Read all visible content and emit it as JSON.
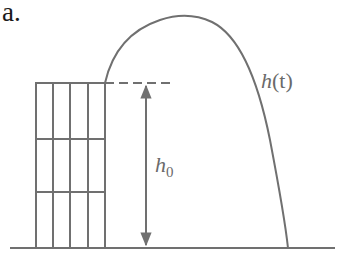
{
  "panel_label": "a.",
  "labels": {
    "trajectory": "h(t)",
    "trajectory_var": "h",
    "trajectory_arg": "(t)",
    "height_var": "h",
    "height_sub": "0"
  },
  "colors": {
    "line": "#707070",
    "text": "#6a6a6a",
    "panel_label": "#1a1a1a",
    "background": "#ffffff"
  },
  "building": {
    "columns": 4,
    "floors": 3
  },
  "geometry": {
    "ground_y": 248,
    "roof_y": 83,
    "building_x": [
      36,
      53,
      70,
      88,
      105
    ],
    "floor_y": [
      83,
      139,
      192,
      248
    ],
    "apex": [
      185,
      16
    ],
    "landing_x": 288
  }
}
